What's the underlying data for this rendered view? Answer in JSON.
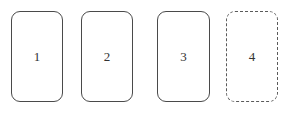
{
  "canvas": {
    "width": 291,
    "height": 114,
    "background_color": "#ffffff"
  },
  "diagram": {
    "type": "rounded-rectangle-row",
    "stroke_color": "#4a4a4a",
    "dashed_stroke_color": "#5a5a5a",
    "label_color": "#333333",
    "corner_radius": 9,
    "box_width": 52,
    "box_height": 91,
    "box_top": 11,
    "boxes": [
      {
        "label": "1",
        "left": 11,
        "top": 11,
        "width": 52,
        "height": 91,
        "border_style": "solid",
        "fill": "none"
      },
      {
        "label": "2",
        "left": 81,
        "top": 11,
        "width": 52,
        "height": 91,
        "border_style": "solid",
        "fill": "none"
      },
      {
        "label": "3",
        "left": 157,
        "top": 11,
        "width": 53,
        "height": 91,
        "border_style": "solid",
        "fill": "none"
      },
      {
        "label": "4",
        "left": 226,
        "top": 11,
        "width": 52,
        "height": 91,
        "border_style": "dashed",
        "fill": "none"
      }
    ]
  }
}
